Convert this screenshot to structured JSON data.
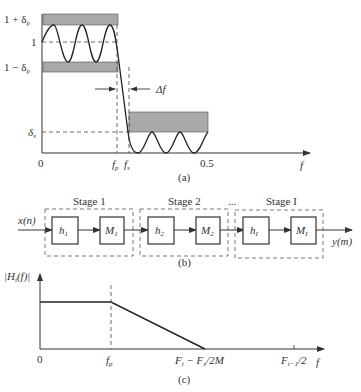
{
  "figure_a": {
    "y_labels": {
      "upper": "1 + δ",
      "upper_sub": "p",
      "one": "1",
      "lower": "1 − δ",
      "lower_sub": "p",
      "stop": "δ",
      "stop_sub": "s"
    },
    "x_labels": {
      "zero": "0",
      "fp": "f",
      "fp_sub": "p",
      "fs": "f",
      "fs_sub": "s",
      "half": "0.5",
      "f": "f"
    },
    "delta_f": "Δf",
    "caption": "(a)"
  },
  "figure_b": {
    "input": "x(n)",
    "output": "y(m)",
    "ellipsis": "...",
    "stages": [
      {
        "label": "Stage 1",
        "filter": "h",
        "filter_sub": "1",
        "decimator": "M",
        "decimator_sub": "1"
      },
      {
        "label": "Stage 2",
        "filter": "h",
        "filter_sub": "2",
        "decimator": "M",
        "decimator_sub": "2"
      },
      {
        "label": "Stage I",
        "filter": "h",
        "filter_sub": "I",
        "decimator": "M",
        "decimator_sub": "I"
      }
    ],
    "caption": "(b)"
  },
  "figure_c": {
    "y_label": "|H",
    "y_label_sub": "i",
    "y_label_rest": "(f)|",
    "x_labels": {
      "zero": "0",
      "fp": "f",
      "fp_sub": "p",
      "fi": "F",
      "fi_sub": "i",
      "fi_rest": " − F",
      "fi_rest_sub": "s",
      "fi_tail": "/2M",
      "fim1": "F",
      "fim1_sub": "i−1",
      "fim1_tail": "/2",
      "f": "f"
    },
    "caption": "(c)"
  }
}
